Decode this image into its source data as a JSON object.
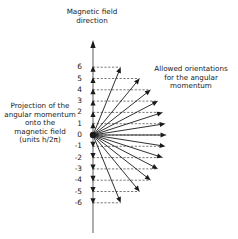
{
  "diagram": {
    "title": "Magnetic field direction",
    "title_lines": [
      "Magnetic field",
      "direction"
    ],
    "orientation_label_lines": [
      "Allowed orientations",
      "for the angular",
      "momentum"
    ],
    "projection_label_lines": [
      "Projection of the",
      "angular momentum",
      "onto the",
      "magnetic field",
      "(units h/2π)"
    ],
    "quantum_number_l": 6,
    "m_values": [
      6,
      5,
      4,
      3,
      2,
      1,
      0,
      -1,
      -2,
      -3,
      -4,
      -5,
      -6
    ],
    "m_labels": [
      "6",
      "5",
      "4",
      "3",
      "2",
      "1",
      "0",
      "-1",
      "-2",
      "-3",
      "-4",
      "-5",
      "-6"
    ],
    "vector_length_units": "sqrt(l(l+1))",
    "colors": {
      "ink": "#1a1a1a",
      "dash": "#555555",
      "background": "#ffffff"
    }
  }
}
